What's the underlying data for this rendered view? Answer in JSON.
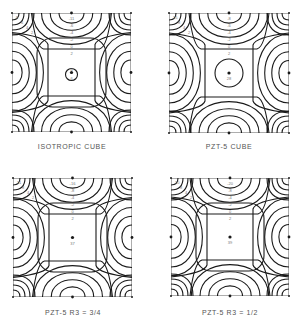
{
  "figure": {
    "panels": [
      {
        "id": "isotropic-cube",
        "caption": "ISOTROPIC CUBE",
        "box": {
          "x": 12,
          "y": 13,
          "size": 119
        },
        "caption_pos": {
          "x": 72,
          "y": 143
        },
        "corner_label": "8",
        "top_labels": [
          "-11",
          "-6",
          "-4",
          "-2",
          "0",
          "2"
        ],
        "corner_labels": [
          "8",
          "6",
          "4",
          "2"
        ],
        "center_label_top": "4",
        "center_label_bottom": "6",
        "center_shape": "small-circle",
        "inner_rounded_square": true
      },
      {
        "id": "pzt5-cube",
        "caption": "PZT-5 CUBE",
        "box": {
          "x": 169,
          "y": 13,
          "size": 120
        },
        "caption_pos": {
          "x": 229,
          "y": 143
        },
        "corner_label": "15",
        "top_labels": [
          "-8",
          "-6",
          "-4",
          "-2",
          "0",
          "2"
        ],
        "corner_labels": [
          "15",
          "8",
          "4",
          "2"
        ],
        "center_label_bottom": "28",
        "center_shape": "circle",
        "inner_rounded_square": false
      },
      {
        "id": "pzt5-r3-3-4",
        "caption": "PZT-5  R3 = 3/4",
        "box": {
          "x": 13,
          "y": 178,
          "size": 119
        },
        "caption_pos": {
          "x": 73,
          "y": 309
        },
        "corner_label": "11",
        "top_labels": [
          "-16",
          "-8",
          "-4",
          "-2",
          "0",
          "2"
        ],
        "corner_labels": [
          "11",
          "8",
          "4",
          "2"
        ],
        "center_label_bottom": "37",
        "center_shape": "none",
        "inner_rounded_square": true
      },
      {
        "id": "pzt5-r3-1-2",
        "caption": "PZT-5  R3 = 1/2",
        "box": {
          "x": 171,
          "y": 178,
          "size": 118
        },
        "caption_pos": {
          "x": 230,
          "y": 309
        },
        "corner_label": "10",
        "top_labels": [
          "-20",
          "-8",
          "-4",
          "-2",
          "0",
          "2"
        ],
        "corner_labels": [
          "10",
          "8",
          "4",
          "2"
        ],
        "center_label_bottom": "39",
        "center_shape": "none",
        "inner_rounded_square": true
      }
    ],
    "line_color": "#1a1a1a",
    "frame_color": "#9a9a9a"
  }
}
